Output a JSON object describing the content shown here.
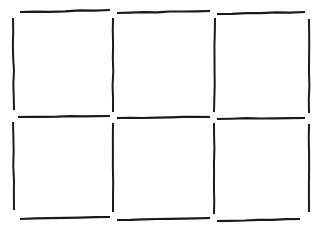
{
  "canvas": {
    "width": 322,
    "height": 230,
    "background_color": "#ffffff",
    "title": "Hand-drawn 3x2 grid of six rectangles"
  },
  "style": {
    "stroke_color": "#1a1a1a",
    "stroke_width": 2.2,
    "stroke_width_thin": 2.0,
    "description": "freehand dark pen strokes with gaps at corners and intersections"
  },
  "grid": {
    "columns": 3,
    "rows": 2,
    "cell_count": 6,
    "column_x_starts": [
      20,
      117,
      217
    ],
    "column_x_ends": [
      110,
      210,
      305
    ],
    "row_y_starts": [
      18,
      122
    ],
    "row_y_ends": [
      110,
      212
    ],
    "vertical_line_x": [
      13,
      113,
      215,
      309
    ],
    "horizontal_line_y": [
      11,
      117,
      219
    ]
  },
  "strokes": {
    "horizontal": [
      {
        "name": "top-segment-left",
        "x1": 20,
        "y1": 12,
        "x2": 110,
        "y2": 10
      },
      {
        "name": "top-segment-middle",
        "x1": 117,
        "y1": 13,
        "x2": 210,
        "y2": 11
      },
      {
        "name": "top-segment-right",
        "x1": 217,
        "y1": 14,
        "x2": 305,
        "y2": 12
      },
      {
        "name": "middle-segment-left",
        "x1": 18,
        "y1": 117,
        "x2": 110,
        "y2": 116
      },
      {
        "name": "middle-segment-middle",
        "x1": 117,
        "y1": 118,
        "x2": 210,
        "y2": 117
      },
      {
        "name": "middle-segment-right",
        "x1": 217,
        "y1": 119,
        "x2": 305,
        "y2": 118
      },
      {
        "name": "bottom-segment-left",
        "x1": 20,
        "y1": 219,
        "x2": 110,
        "y2": 217
      },
      {
        "name": "bottom-segment-middle",
        "x1": 117,
        "y1": 220,
        "x2": 210,
        "y2": 218
      },
      {
        "name": "bottom-segment-right",
        "x1": 217,
        "y1": 221,
        "x2": 300,
        "y2": 219
      }
    ],
    "vertical": [
      {
        "name": "left-edge-upper",
        "x1": 13,
        "y1": 18,
        "x2": 14,
        "y2": 110
      },
      {
        "name": "left-edge-lower",
        "x1": 13,
        "y1": 122,
        "x2": 14,
        "y2": 210
      },
      {
        "name": "divider-1-upper",
        "x1": 113,
        "y1": 18,
        "x2": 113,
        "y2": 112
      },
      {
        "name": "divider-1-lower",
        "x1": 113,
        "y1": 123,
        "x2": 113,
        "y2": 212
      },
      {
        "name": "divider-2-upper",
        "x1": 215,
        "y1": 18,
        "x2": 214,
        "y2": 112
      },
      {
        "name": "divider-2-lower",
        "x1": 214,
        "y1": 123,
        "x2": 214,
        "y2": 214
      },
      {
        "name": "right-edge-upper",
        "x1": 309,
        "y1": 19,
        "x2": 309,
        "y2": 113
      },
      {
        "name": "right-edge-lower",
        "x1": 309,
        "y1": 124,
        "x2": 309,
        "y2": 212
      }
    ]
  },
  "cells": [
    {
      "name": "cell-r1c1",
      "row": 1,
      "col": 1,
      "content": ""
    },
    {
      "name": "cell-r1c2",
      "row": 1,
      "col": 2,
      "content": ""
    },
    {
      "name": "cell-r1c3",
      "row": 1,
      "col": 3,
      "content": ""
    },
    {
      "name": "cell-r2c1",
      "row": 2,
      "col": 1,
      "content": ""
    },
    {
      "name": "cell-r2c2",
      "row": 2,
      "col": 2,
      "content": ""
    },
    {
      "name": "cell-r2c3",
      "row": 2,
      "col": 3,
      "content": ""
    }
  ]
}
